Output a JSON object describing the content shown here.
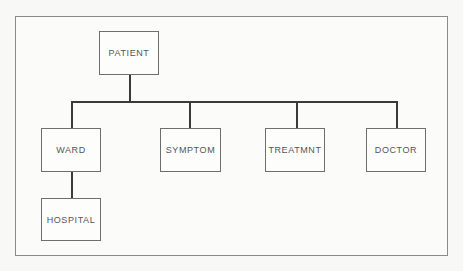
{
  "diagram": {
    "type": "hierarchy",
    "root": {
      "label": "PATIENT"
    },
    "children": [
      {
        "label": "WARD",
        "children": [
          {
            "label": "HOSPITAL"
          }
        ]
      },
      {
        "label": "SYMPTOM"
      },
      {
        "label": "TREATMNT"
      },
      {
        "label": "DOCTOR"
      }
    ]
  },
  "nodes": {
    "patient": "PATIENT",
    "ward": "WARD",
    "hospital": "HOSPITAL",
    "symptom": "SYMPTOM",
    "treatment": "TREATMNT",
    "doctor": "DOCTOR"
  },
  "colors": {
    "line": "#3a3a3a",
    "box_border": "#6e6e6e",
    "text": "#555555",
    "background": "#f8f8f6"
  }
}
